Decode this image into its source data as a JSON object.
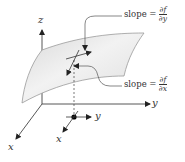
{
  "diagram": {
    "type": "partial-derivative-surface",
    "axes": {
      "z_label": "z",
      "y_label": "y",
      "x_label": "x"
    },
    "base_point_axes": {
      "y_label": "y",
      "x_label": "x"
    },
    "annotations": [
      {
        "id": "slope-y",
        "text": "slope =",
        "numerator": "∂f",
        "denominator": "∂y"
      },
      {
        "id": "slope-x",
        "text": "slope =",
        "numerator": "∂f",
        "denominator": "∂x"
      }
    ],
    "colors": {
      "surface_fill": "#e6e6e6",
      "surface_edge": "#9a9a9a",
      "axis": "#333333",
      "point": "#000000"
    }
  }
}
